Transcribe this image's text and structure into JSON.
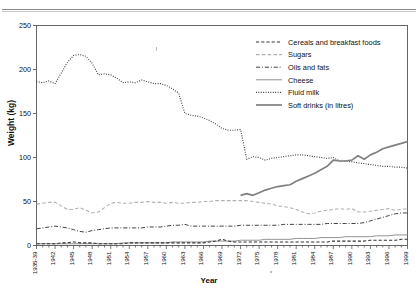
{
  "figure": {
    "x_axis_title": "Year",
    "y_axis_title": "Weight (kg)",
    "cut_off_header": "",
    "colors": {
      "axis": "#555555",
      "cereals": "#333333",
      "sugars": "#b0b0b0",
      "oils": "#444444",
      "cheese": "#8c8c8c",
      "milk": "#333333",
      "softdrinks": "#808080",
      "background": "#ffffff"
    }
  },
  "legend": {
    "position": "top-right",
    "items": [
      {
        "label": "Cereals and breakfast foods",
        "style": "dashed"
      },
      {
        "label": "Sugars",
        "style": "dashed-light"
      },
      {
        "label": "Oils and fats",
        "style": "dash-dot"
      },
      {
        "label": "Cheese",
        "style": "solid-thin"
      },
      {
        "label": "Fluid milk",
        "style": "dotted"
      },
      {
        "label": "Soft drinks (in litres)",
        "style": "solid-thick"
      }
    ]
  },
  "chart_data": {
    "type": "line",
    "title": "",
    "xlabel": "Year",
    "ylabel": "Weight (kg)",
    "ylim": [
      0,
      250
    ],
    "yticks": [
      0,
      50,
      100,
      150,
      200,
      250
    ],
    "grid": false,
    "legend_position": "top-right",
    "x": [
      "1935-39",
      "1940",
      "1941",
      "1942",
      "1943",
      "1944",
      "1945",
      "1946",
      "1947",
      "1948",
      "1949",
      "1950",
      "1951",
      "1952",
      "1953",
      "1954",
      "1955",
      "1956",
      "1957",
      "1958",
      "1959",
      "1960",
      "1961",
      "1962",
      "1963",
      "1964",
      "1965",
      "1966",
      "1967",
      "1968",
      "1969",
      "1970",
      "1971",
      "1972",
      "1973",
      "1974",
      "1975",
      "1976",
      "1977",
      "1978",
      "1979",
      "1980",
      "1981",
      "1982",
      "1983",
      "1984",
      "1985",
      "1986",
      "1987",
      "1988",
      "1989",
      "1990",
      "1991",
      "1992",
      "1993",
      "1994",
      "1995",
      "1996",
      "1997",
      "1998",
      "1999"
    ],
    "xtick_labels": [
      "1935-39",
      "1942",
      "1945",
      "1948",
      "1951",
      "1954",
      "1957",
      "1960",
      "1963",
      "1966",
      "1969",
      "1972",
      "1975",
      "1978",
      "1981",
      "1984",
      "1987",
      "1990",
      "1993",
      "1996",
      "1999"
    ],
    "series": [
      {
        "name": "Fluid milk",
        "style": "dotted",
        "values": [
          186,
          185,
          187,
          184,
          196,
          208,
          216,
          217,
          215,
          207,
          194,
          195,
          194,
          190,
          185,
          186,
          185,
          188,
          186,
          184,
          184,
          182,
          178,
          173,
          150,
          148,
          147,
          145,
          142,
          138,
          133,
          131,
          131,
          132,
          98,
          101,
          100,
          97,
          99,
          100,
          101,
          102,
          103,
          103,
          102,
          101,
          100,
          99,
          100,
          96,
          96,
          95,
          94,
          93,
          92,
          91,
          90,
          90,
          89,
          89,
          88
        ]
      },
      {
        "name": "Soft drinks (in litres)",
        "style": "solid-thick",
        "values": [
          null,
          null,
          null,
          null,
          null,
          null,
          null,
          null,
          null,
          null,
          null,
          null,
          null,
          null,
          null,
          null,
          null,
          null,
          null,
          null,
          null,
          null,
          null,
          null,
          null,
          null,
          null,
          null,
          null,
          null,
          null,
          null,
          null,
          57,
          59,
          57,
          60,
          63,
          65,
          67,
          68,
          69,
          73,
          76,
          79,
          82,
          86,
          90,
          97,
          96,
          96,
          97,
          102,
          98,
          103,
          106,
          110,
          112,
          114,
          116,
          118
        ]
      },
      {
        "name": "Sugars",
        "style": "dashed-light",
        "values": [
          47,
          48,
          49,
          49,
          45,
          41,
          41,
          43,
          40,
          37,
          38,
          43,
          48,
          49,
          48,
          48,
          49,
          49,
          50,
          49,
          49,
          48,
          49,
          48,
          48,
          49,
          49,
          50,
          50,
          51,
          51,
          51,
          51,
          51,
          51,
          50,
          49,
          48,
          47,
          45,
          44,
          43,
          41,
          38,
          36,
          37,
          39,
          40,
          41,
          42,
          41,
          42,
          38,
          38,
          39,
          40,
          41,
          42,
          40,
          41,
          42
        ]
      },
      {
        "name": "Oils and fats",
        "style": "dash-dot",
        "values": [
          19,
          20,
          21,
          22,
          21,
          20,
          18,
          16,
          15,
          17,
          18,
          19,
          20,
          20,
          20,
          20,
          20,
          20,
          21,
          21,
          21,
          22,
          23,
          23,
          24,
          22,
          22,
          22,
          22,
          22,
          22,
          22,
          22,
          23,
          23,
          23,
          23,
          23,
          23,
          23,
          24,
          24,
          24,
          24,
          24,
          24,
          24,
          25,
          25,
          25,
          25,
          25,
          25,
          26,
          28,
          30,
          32,
          34,
          36,
          37,
          37
        ]
      },
      {
        "name": "Cheese",
        "style": "solid-thin",
        "values": [
          2,
          2,
          2,
          2,
          2,
          2,
          2,
          2,
          2,
          2,
          2,
          2,
          2,
          2,
          3,
          3,
          3,
          3,
          3,
          3,
          3,
          3,
          4,
          4,
          4,
          4,
          4,
          4,
          5,
          5,
          5,
          5,
          5,
          6,
          6,
          6,
          6,
          7,
          7,
          7,
          7,
          7,
          8,
          8,
          8,
          8,
          9,
          9,
          9,
          9,
          10,
          10,
          10,
          10,
          10,
          11,
          11,
          11,
          12,
          12,
          12
        ]
      },
      {
        "name": "Cereals and breakfast foods",
        "style": "dashed",
        "values": [
          2,
          2,
          2,
          2,
          3,
          3,
          4,
          3,
          3,
          3,
          2,
          2,
          2,
          2,
          2,
          3,
          3,
          3,
          3,
          3,
          3,
          3,
          3,
          3,
          3,
          3,
          3,
          3,
          4,
          5,
          7,
          5,
          4,
          4,
          4,
          4,
          4,
          4,
          4,
          4,
          4,
          4,
          4,
          4,
          4,
          4,
          4,
          4,
          5,
          5,
          5,
          5,
          5,
          5,
          6,
          6,
          6,
          6,
          6,
          7,
          7
        ]
      }
    ]
  }
}
